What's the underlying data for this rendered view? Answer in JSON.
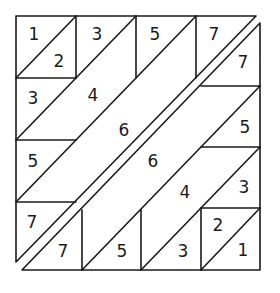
{
  "diagram": {
    "type": "dissection-puzzle",
    "stroke_color": "#1a1a1a",
    "background": "#ffffff",
    "upper_piece": {
      "outline": [
        [
          16,
          16
        ],
        [
          256,
          16
        ],
        [
          16,
          262
        ]
      ],
      "lines": [
        [
          [
            76,
            16
          ],
          [
            76,
            78
          ]
        ],
        [
          [
            136,
            16
          ],
          [
            136,
            78
          ]
        ],
        [
          [
            196,
            16
          ],
          [
            196,
            78
          ]
        ],
        [
          [
            16,
            78
          ],
          [
            76,
            78
          ]
        ],
        [
          [
            16,
            140
          ],
          [
            76,
            140
          ]
        ],
        [
          [
            16,
            202
          ],
          [
            76,
            202
          ]
        ],
        [
          [
            16,
            78
          ],
          [
            76,
            16
          ]
        ],
        [
          [
            16,
            140
          ],
          [
            136,
            16
          ]
        ],
        [
          [
            16,
            202
          ],
          [
            196,
            16
          ]
        ]
      ],
      "labels": [
        {
          "text": "1",
          "x": 34,
          "y": 34
        },
        {
          "text": "2",
          "x": 59,
          "y": 61
        },
        {
          "text": "3",
          "x": 97,
          "y": 34
        },
        {
          "text": "5",
          "x": 155,
          "y": 34
        },
        {
          "text": "7",
          "x": 214,
          "y": 34
        },
        {
          "text": "3",
          "x": 33,
          "y": 98
        },
        {
          "text": "4",
          "x": 93,
          "y": 95
        },
        {
          "text": "6",
          "x": 124,
          "y": 130
        },
        {
          "text": "5",
          "x": 33,
          "y": 161
        },
        {
          "text": "7",
          "x": 32,
          "y": 222
        }
      ]
    },
    "lower_piece": {
      "outline": [
        [
          260,
          23
        ],
        [
          260,
          270
        ],
        [
          22,
          270
        ]
      ],
      "lines": [
        [
          [
            82,
            210
          ],
          [
            82,
            270
          ]
        ],
        [
          [
            141,
            210
          ],
          [
            141,
            270
          ]
        ],
        [
          [
            201,
            208
          ],
          [
            201,
            270
          ]
        ],
        [
          [
            201,
            208
          ],
          [
            260,
            208
          ]
        ],
        [
          [
            201,
            147
          ],
          [
            260,
            147
          ]
        ],
        [
          [
            201,
            86
          ],
          [
            260,
            86
          ]
        ],
        [
          [
            201,
            270
          ],
          [
            260,
            208
          ]
        ],
        [
          [
            141,
            270
          ],
          [
            260,
            147
          ]
        ],
        [
          [
            82,
            270
          ],
          [
            260,
            86
          ]
        ]
      ],
      "labels": [
        {
          "text": "7",
          "x": 243,
          "y": 62
        },
        {
          "text": "6",
          "x": 153,
          "y": 161
        },
        {
          "text": "5",
          "x": 245,
          "y": 127
        },
        {
          "text": "4",
          "x": 185,
          "y": 192
        },
        {
          "text": "3",
          "x": 244,
          "y": 187
        },
        {
          "text": "2",
          "x": 218,
          "y": 225
        },
        {
          "text": "1",
          "x": 243,
          "y": 250
        },
        {
          "text": "7",
          "x": 63,
          "y": 251
        },
        {
          "text": "5",
          "x": 122,
          "y": 251
        },
        {
          "text": "3",
          "x": 183,
          "y": 251
        }
      ]
    }
  }
}
